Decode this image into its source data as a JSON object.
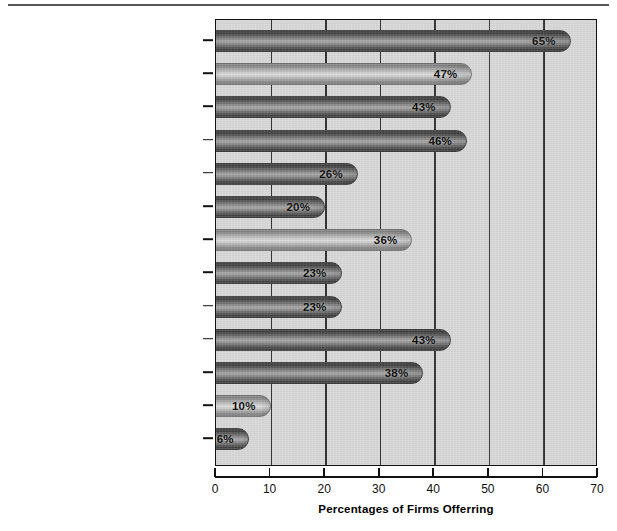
{
  "chart_data": {
    "type": "bar",
    "orientation": "horizontal",
    "title": "",
    "xlabel": "Percentages of Firms Offerring",
    "ylabel": "",
    "xlim": [
      0,
      70
    ],
    "xticks": [
      "0",
      "10",
      "20",
      "30",
      "40",
      "50",
      "60",
      "70"
    ],
    "grid": true,
    "legend": null,
    "categories": [
      "Annual Physical",
      "Company Car",
      "Car Allowance",
      "Car Phone",
      "First-class Air Travel",
      "Company Airplane Usage",
      "Country Club Membership",
      "Health Club Membership",
      "Luncheon Club Membership",
      "Financial Planning",
      "Tax Planning/Tax Return Preparation",
      "Legal Counseling",
      "No/Low-Interest Loans"
    ],
    "values": [
      65,
      47,
      43,
      46,
      26,
      20,
      36,
      23,
      23,
      43,
      38,
      10,
      6
    ],
    "data_labels": [
      "65%",
      "47%",
      "43%",
      "46%",
      "26%",
      "20%",
      "36%",
      "23%",
      "23%",
      "43%",
      "38%",
      "10%",
      "6%"
    ],
    "bar_shades": [
      "dark",
      "light",
      "dark",
      "dark",
      "dark",
      "dark",
      "light",
      "dark",
      "dark",
      "dark",
      "dark",
      "light",
      "dark"
    ],
    "colors": {
      "plot_background": "#d7d7d7",
      "gridline": "#2b2b2b",
      "axis": "#111111",
      "bar_dark": "#5d5d5d",
      "bar_light": "#b0b0b0",
      "text": "#111111"
    }
  }
}
